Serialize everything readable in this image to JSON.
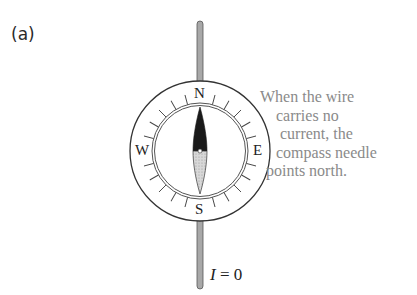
{
  "figure": {
    "panel_label": "(a)",
    "compass": {
      "directions": {
        "north": "N",
        "south": "S",
        "east": "E",
        "west": "W"
      },
      "needle_north_color": "#1a1a1a",
      "needle_south_color": "#c8c8c8"
    },
    "wire": {
      "color": "#9a9a9a"
    },
    "caption_lines": [
      "When the wire",
      "carries no",
      "current, the",
      "compass needle",
      "points north."
    ],
    "current_label": {
      "symbol": "I",
      "equals": " = ",
      "value": "0"
    }
  }
}
